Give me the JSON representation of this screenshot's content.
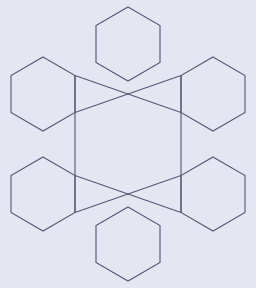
{
  "figure": {
    "title": "Hexagonal snowflake lattice",
    "canvas": {
      "width": 256,
      "height": 288,
      "background_color": "#e4e6f2"
    },
    "style": {
      "stroke_color": "#555a7a",
      "stroke_width": 1.15,
      "fill": "none"
    },
    "geometry": {
      "hexagon_radius": 37,
      "hexagon_orientation": "pointy-top",
      "center_x": 128,
      "center_y": 144
    },
    "hexagons": [
      {
        "name": "top-hexagon",
        "center_x": 128,
        "center_y": 44,
        "points": "128,7 160,25.5 160,62.5 128,81 96,62.5 96,25.5"
      },
      {
        "name": "upper-left-hexagon",
        "center_x": 43,
        "center_y": 94,
        "points": "43,57 75,75.5 75,112.5 43,131 11,112.5 11,75.5"
      },
      {
        "name": "upper-right-hexagon",
        "center_x": 213,
        "center_y": 94,
        "points": "213,57 245,75.5 245,112.5 213,131 181,112.5 181,75.5"
      },
      {
        "name": "lower-left-hexagon",
        "center_x": 43,
        "center_y": 194,
        "points": "43,157 75,175.5 75,212.5 43,231 11,212.5 11,175.5"
      },
      {
        "name": "lower-right-hexagon",
        "center_x": 213,
        "center_y": 194,
        "points": "213,157 245,175.5 245,212.5 213,231 181,212.5 181,175.5"
      },
      {
        "name": "bottom-hexagon",
        "center_x": 128,
        "center_y": 244,
        "points": "128,207 160,225.5 160,262.5 128,281 96,262.5 96,225.5"
      }
    ],
    "connectors": [
      {
        "name": "left-vertical-rail",
        "from_x": 75,
        "from_y": 75.5,
        "to_x": 75,
        "to_y": 212.5
      },
      {
        "name": "right-vertical-rail",
        "from_x": 181,
        "from_y": 75.5,
        "to_x": 181,
        "to_y": 212.5
      },
      {
        "name": "upper-left-to-upper-right-diagonal",
        "from_x": 75,
        "from_y": 75.5,
        "to_x": 181,
        "to_y": 112.5
      },
      {
        "name": "upper-right-to-upper-left-diagonal",
        "from_x": 181,
        "from_y": 75.5,
        "to_x": 75,
        "to_y": 112.5
      },
      {
        "name": "lower-left-to-lower-right-diagonal",
        "from_x": 75,
        "from_y": 175.5,
        "to_x": 181,
        "to_y": 212.5
      },
      {
        "name": "lower-right-to-lower-left-diagonal",
        "from_x": 181,
        "from_y": 175.5,
        "to_x": 75,
        "to_y": 212.5
      }
    ],
    "crossings": [
      {
        "name": "upper-crossing",
        "x": 128,
        "y": 94
      },
      {
        "name": "lower-crossing",
        "x": 128,
        "y": 194
      }
    ]
  }
}
